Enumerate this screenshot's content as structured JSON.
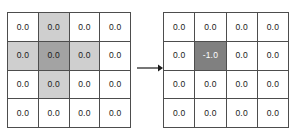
{
  "figure": {
    "background_color": "#ffffff",
    "cell_border_color": "#4d4d4d",
    "text_color": "#1a1a1a",
    "shade_light_color": "#cfcfcf",
    "shade_dark_color": "#a3a3a3",
    "shade_mid_color": "#808080",
    "shade_mid_text_color": "#ffffff"
  },
  "grid_left": {
    "label": "before-grid",
    "rows": 4,
    "cols": 4,
    "values": [
      [
        "0.0",
        "0.0",
        "0.0",
        "0.0"
      ],
      [
        "0.0",
        "0.0",
        "0.0",
        "0.0"
      ],
      [
        "0.0",
        "0.0",
        "0.0",
        "0.0"
      ],
      [
        "0.0",
        "0.0",
        "0.0",
        "0.0"
      ]
    ],
    "shading": [
      [
        "none",
        "light",
        "none",
        "none"
      ],
      [
        "light",
        "dark",
        "light",
        "none"
      ],
      [
        "none",
        "light",
        "none",
        "none"
      ],
      [
        "none",
        "none",
        "none",
        "none"
      ]
    ]
  },
  "arrow": {
    "label": "transformation-arrow",
    "direction": "right",
    "color": "#1a1a1a"
  },
  "grid_right": {
    "label": "after-grid",
    "rows": 4,
    "cols": 4,
    "values": [
      [
        "0.0",
        "0.0",
        "0.0",
        "0.0"
      ],
      [
        "0.0",
        "-1.0",
        "0.0",
        "0.0"
      ],
      [
        "0.0",
        "0.0",
        "0.0",
        "0.0"
      ],
      [
        "0.0",
        "0.0",
        "0.0",
        "0.0"
      ]
    ],
    "shading": [
      [
        "none",
        "none",
        "none",
        "none"
      ],
      [
        "none",
        "mid",
        "none",
        "none"
      ],
      [
        "none",
        "none",
        "none",
        "none"
      ],
      [
        "none",
        "none",
        "none",
        "none"
      ]
    ]
  }
}
